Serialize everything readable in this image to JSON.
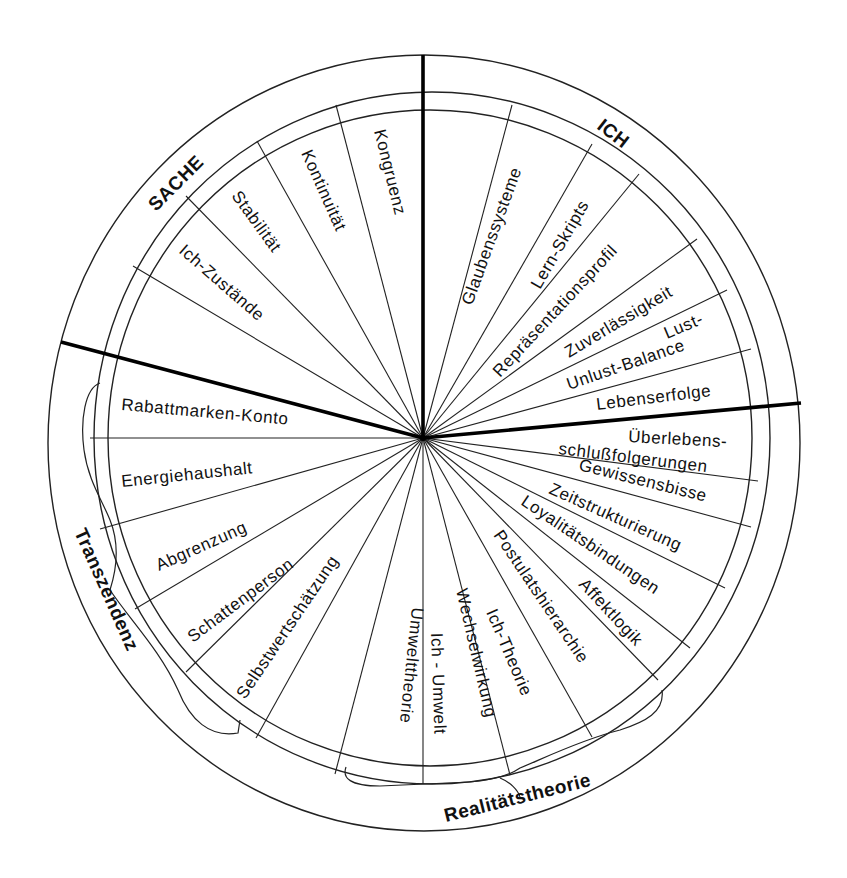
{
  "diagram": {
    "type": "circular segment diagram",
    "center": [
      423,
      438
    ],
    "categories": {
      "sache": "SACHE",
      "ich": "ICH",
      "transzendenz": "Transzendenz",
      "realitaetstheorie": "Realitätstheorie"
    },
    "segments": {
      "sache": [
        "Kongruenz",
        "Kontinuität",
        "Stabilität",
        "Ich-Zustände"
      ],
      "ich": [
        "Glaubenssysteme",
        "Lern-Skripts",
        "Repräsentationsprofil",
        "Zuverlässigkeit",
        "Lust-",
        "Unlust-Balance",
        "Lebenserfolge"
      ],
      "right_lower": [
        "Überlebens-",
        "schlußfolgerungen",
        "Gewissensbisse",
        "Zeitstrukturierung",
        "Loyalitätsbindungen",
        "Affektlogik",
        "Postulatshierarchie",
        "Ich-Theorie",
        "Wechselwirkung",
        "Ich - Umwelt"
      ],
      "transzendenz": [
        "Rabattmarken-Konto",
        "Energiehaushalt",
        "Abgrenzung",
        "Schattenperson",
        "Selbstwertschätzung",
        "Umwelttheorie"
      ]
    },
    "colors": {
      "line": "#222222",
      "divider": "#000000",
      "background": "#ffffff"
    }
  }
}
